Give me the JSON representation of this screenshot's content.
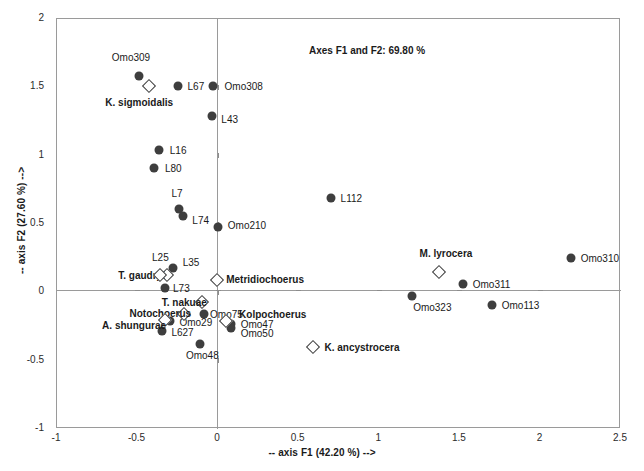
{
  "scan_artifact": "",
  "chart_data": {
    "type": "scatter",
    "title": "Axes F1 and F2: 69.80 %",
    "xlabel": "-- axis F1 (42.20 %) -->",
    "ylabel": "-- axis F2 (27.60 %) -->",
    "xlim": [
      -1,
      2.5
    ],
    "ylim": [
      -1,
      2
    ],
    "xticks": [
      "-1",
      "-0.5",
      "0",
      "0.5",
      "1",
      "1.5",
      "2",
      "2.5"
    ],
    "xtick_values": [
      -1,
      -0.5,
      0,
      0.5,
      1,
      1.5,
      2,
      2.5
    ],
    "yticks": [
      "2",
      "1.5",
      "1",
      "0.5",
      "0",
      "-0.5",
      "-1"
    ],
    "ytick_values": [
      2,
      1.5,
      1,
      0.5,
      0,
      -0.5,
      -1
    ],
    "grid": false,
    "legend": "none",
    "series": [
      {
        "name": "sites",
        "marker": "filled-circle",
        "color": "#3e3e3e",
        "points": [
          {
            "label": "Omo309",
            "x": -0.49,
            "y": 1.58,
            "lx": -0.66,
            "ly": 1.72,
            "bold": false
          },
          {
            "label": "L67",
            "x": -0.25,
            "y": 1.51,
            "lx": -0.19,
            "ly": 1.51,
            "bold": false
          },
          {
            "label": "Omo308",
            "x": -0.03,
            "y": 1.51,
            "lx": 0.04,
            "ly": 1.51,
            "bold": false
          },
          {
            "label": "L43",
            "x": -0.04,
            "y": 1.29,
            "lx": 0.02,
            "ly": 1.27,
            "bold": false
          },
          {
            "label": "L16",
            "x": -0.37,
            "y": 1.04,
            "lx": -0.3,
            "ly": 1.04,
            "bold": false
          },
          {
            "label": "L80",
            "x": -0.4,
            "y": 0.91,
            "lx": -0.33,
            "ly": 0.91,
            "bold": false
          },
          {
            "label": "L7",
            "x": -0.24,
            "y": 0.61,
            "lx": -0.29,
            "ly": 0.73,
            "bold": false
          },
          {
            "label": "L74",
            "x": -0.22,
            "y": 0.56,
            "lx": -0.16,
            "ly": 0.53,
            "bold": false
          },
          {
            "label": "Omo210",
            "x": 0.0,
            "y": 0.48,
            "lx": 0.06,
            "ly": 0.49,
            "bold": false
          },
          {
            "label": "L112",
            "x": 0.7,
            "y": 0.69,
            "lx": 0.76,
            "ly": 0.69,
            "bold": false
          },
          {
            "label": "Omo310",
            "x": 2.19,
            "y": 0.25,
            "lx": 2.25,
            "ly": 0.25,
            "bold": false
          },
          {
            "label": "Omo311",
            "x": 1.52,
            "y": 0.06,
            "lx": 1.58,
            "ly": 0.06,
            "bold": false
          },
          {
            "label": "Omo323",
            "x": 1.2,
            "y": -0.03,
            "lx": 1.21,
            "ly": -0.11,
            "bold": false
          },
          {
            "label": "Omo113",
            "x": 1.7,
            "y": -0.09,
            "lx": 1.76,
            "ly": -0.09,
            "bold": false
          },
          {
            "label": "L35",
            "x": -0.28,
            "y": 0.18,
            "lx": -0.22,
            "ly": 0.22,
            "bold": false
          },
          {
            "label": "L73",
            "x": -0.33,
            "y": 0.03,
            "lx": -0.28,
            "ly": 0.03,
            "bold": false
          },
          {
            "label": "Omo75",
            "x": -0.09,
            "y": -0.16,
            "lx": -0.05,
            "ly": -0.16,
            "bold": false
          },
          {
            "label": "Omo29",
            "x": -0.3,
            "y": -0.21,
            "lx": -0.24,
            "ly": -0.22,
            "bold": false
          },
          {
            "label": "L627",
            "x": -0.35,
            "y": -0.28,
            "lx": -0.29,
            "ly": -0.29,
            "bold": false
          },
          {
            "label": "Omo47",
            "x": 0.08,
            "y": -0.23,
            "lx": 0.14,
            "ly": -0.23,
            "bold": false
          },
          {
            "label": "Omo50",
            "x": 0.08,
            "y": -0.26,
            "lx": 0.14,
            "ly": -0.3,
            "bold": false
          },
          {
            "label": "Omo48",
            "x": -0.11,
            "y": -0.38,
            "lx": -0.2,
            "ly": -0.46,
            "bold": false
          }
        ]
      },
      {
        "name": "taxa",
        "marker": "open-diamond",
        "color": "#3a3a3a",
        "points": [
          {
            "label": "K. sigmoidalis",
            "x": -0.43,
            "y": 1.51,
            "lx": -0.7,
            "ly": 1.39,
            "bold": true
          },
          {
            "label": "M. lyrocera",
            "x": 1.37,
            "y": 0.15,
            "lx": 1.25,
            "ly": 0.29,
            "bold": true
          },
          {
            "label": "Metridiochoerus",
            "x": -0.01,
            "y": 0.09,
            "lx": 0.05,
            "ly": 0.1,
            "bold": true
          },
          {
            "label": "T. gaudryi",
            "x": -0.32,
            "y": 0.13,
            "lx": -0.62,
            "ly": 0.13,
            "bold": true
          },
          {
            "label": "T. nakuae",
            "x": -0.1,
            "y": -0.07,
            "lx": -0.35,
            "ly": -0.07,
            "bold": true
          },
          {
            "label": "Notochoerus",
            "x": -0.21,
            "y": -0.16,
            "lx": -0.55,
            "ly": -0.15,
            "bold": true
          },
          {
            "label": "A. shungurae",
            "x": -0.33,
            "y": -0.2,
            "lx": -0.72,
            "ly": -0.24,
            "bold": true
          },
          {
            "label": "Kolpochoerus",
            "x": 0.05,
            "y": -0.21,
            "lx": 0.13,
            "ly": -0.16,
            "bold": true
          },
          {
            "label": "K. ancystrocera",
            "x": 0.59,
            "y": -0.4,
            "lx": 0.66,
            "ly": -0.4,
            "bold": true
          },
          {
            "label": "L25",
            "x": -0.36,
            "y": 0.13,
            "lx": -0.41,
            "ly": 0.26,
            "bold": false
          }
        ]
      }
    ]
  }
}
